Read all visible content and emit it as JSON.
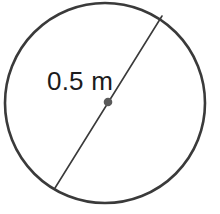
{
  "figure": {
    "background_color": "#ffffff",
    "stroke_color": "#3a3a3a",
    "center_dot_color": "#5a5a5a",
    "label_color": "#1c1c1c",
    "measurement_label": "0.5 m",
    "measurement_value": "0.5",
    "measurement_unit": "m",
    "measurement_kind": "diameter",
    "circle": {
      "center_x": 105,
      "center_y": 103,
      "radius": 100,
      "stroke_width": 2.6,
      "fill": "none"
    },
    "diameter_line": {
      "x1": 162,
      "y1": 16,
      "x2": 55,
      "y2": 188,
      "stroke_width": 1.6
    },
    "center_dot": {
      "cx": 108,
      "cy": 102,
      "r": 4.3
    },
    "label_position": {
      "x": 47,
      "y": 90
    }
  }
}
